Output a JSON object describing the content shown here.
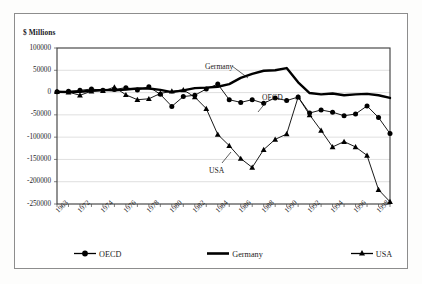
{
  "figure": {
    "y_axis_title": "$ Millions",
    "frame": true
  },
  "legend": {
    "position": "bottom",
    "items": [
      {
        "label": "OECD",
        "key": "line-circle-marker",
        "color": "#000000"
      },
      {
        "label": "Germany",
        "key": "thick-line",
        "color": "#000000"
      },
      {
        "label": "USA",
        "key": "line-triangle-marker",
        "color": "#000000"
      }
    ]
  },
  "annotations": [
    {
      "text": "Germany",
      "x": 205,
      "y": 62
    },
    {
      "text": "OECD",
      "x": 262,
      "y": 93
    },
    {
      "text": "USA",
      "x": 209,
      "y": 166
    }
  ],
  "chart_data": {
    "type": "line",
    "title": "",
    "xlabel": "",
    "ylabel": "$ Millions",
    "ylim": [
      -250000,
      100000
    ],
    "ytick_step": 50000,
    "yticks": [
      100000,
      50000,
      0,
      -50000,
      -100000,
      -150000,
      -200000,
      -250000
    ],
    "ytick_labels": [
      "100000",
      "50000",
      "0",
      "-50000",
      "-100000",
      "-150000",
      "-200000",
      "-250000"
    ],
    "grid": true,
    "x": [
      1970,
      1971,
      1972,
      1973,
      1974,
      1975,
      1976,
      1977,
      1978,
      1979,
      1980,
      1981,
      1982,
      1983,
      1984,
      1985,
      1986,
      1987,
      1988,
      1989,
      1990,
      1991,
      1992,
      1993,
      1994,
      1995,
      1996,
      1997,
      1998,
      1999
    ],
    "xtick_labels": [
      "1963",
      "1972",
      "1974",
      "1976",
      "1978",
      "1980",
      "1982",
      "1984",
      "1986",
      "1988",
      "1990",
      "1992",
      "1994",
      "1996",
      "1998"
    ],
    "xtick_label_values": [
      1970,
      1972,
      1974,
      1976,
      1978,
      1980,
      1982,
      1984,
      1986,
      1988,
      1990,
      1992,
      1994,
      1996,
      1998
    ],
    "series": [
      {
        "name": "OECD",
        "marker": "circle",
        "values": [
          2000,
          3000,
          5000,
          8000,
          5000,
          7000,
          11000,
          6000,
          13000,
          -4000,
          -31000,
          -9000,
          -6000,
          8000,
          19000,
          -16000,
          -22000,
          -16000,
          -24000,
          -12000,
          -18000,
          -10000,
          -46000,
          -39000,
          -44000,
          -52000,
          -48000,
          -30000,
          -56000,
          -92000
        ]
      },
      {
        "name": "Germany",
        "marker": "none",
        "values": [
          2000,
          1000,
          2000,
          4000,
          6000,
          5000,
          7000,
          9000,
          9000,
          6000,
          1000,
          5000,
          10000,
          11000,
          13000,
          19000,
          33000,
          42000,
          49000,
          50000,
          55000,
          23000,
          -1000,
          -4000,
          -2000,
          -6000,
          -4000,
          -3000,
          -6000,
          -12000
        ]
      },
      {
        "name": "USA",
        "marker": "triangle",
        "values": [
          2000,
          1000,
          -6000,
          3000,
          4000,
          12000,
          -5000,
          -16000,
          -14000,
          -2000,
          3000,
          6000,
          -10000,
          -36000,
          -94000,
          -119000,
          -148000,
          -168000,
          -128000,
          -105000,
          -93000,
          -10000,
          -50000,
          -85000,
          -122000,
          -110000,
          -122000,
          -141000,
          -218000,
          -245000
        ]
      }
    ]
  }
}
